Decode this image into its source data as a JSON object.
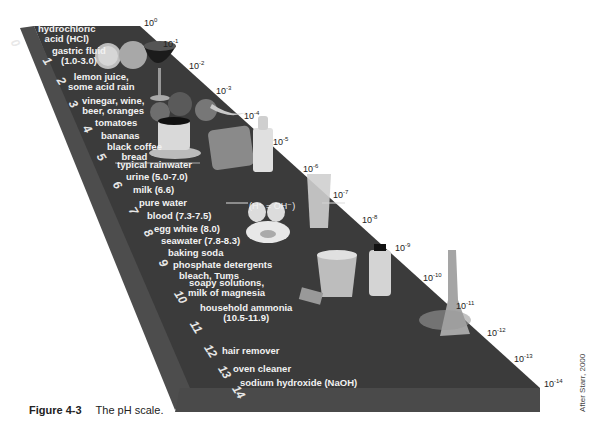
{
  "figure": {
    "number_label": "Figure 4-3",
    "caption": "The pH scale.",
    "credit": "After Starr, 2000"
  },
  "scale": {
    "ph_numbers": [
      "0",
      "1",
      "2",
      "3",
      "4",
      "5",
      "6",
      "7",
      "8",
      "9",
      "10",
      "11",
      "12",
      "13",
      "14"
    ],
    "concentrations": [
      {
        "base": "10",
        "exp": "0"
      },
      {
        "base": "10",
        "exp": "-1"
      },
      {
        "base": "10",
        "exp": "-2"
      },
      {
        "base": "10",
        "exp": "-3"
      },
      {
        "base": "10",
        "exp": "-4"
      },
      {
        "base": "10",
        "exp": "-5"
      },
      {
        "base": "10",
        "exp": "-6"
      },
      {
        "base": "10",
        "exp": "-7"
      },
      {
        "base": "10",
        "exp": "-8"
      },
      {
        "base": "10",
        "exp": "-9"
      },
      {
        "base": "10",
        "exp": "-10"
      },
      {
        "base": "10",
        "exp": "-11"
      },
      {
        "base": "10",
        "exp": "-12"
      },
      {
        "base": "10",
        "exp": "-13"
      },
      {
        "base": "10",
        "exp": "-14"
      }
    ],
    "neutral_equation": "(H⁺ = OH⁻)"
  },
  "substances": [
    {
      "label": "hydrochloric\nacid (HCl)"
    },
    {
      "label": "gastric fluid\n(1.0-3.0)"
    },
    {
      "label": "lemon juice,\nsome acid rain"
    },
    {
      "label": "vinegar, wine,\nbeer, oranges"
    },
    {
      "label": "tomatoes"
    },
    {
      "label": "bananas"
    },
    {
      "label": "black coffee\nbread"
    },
    {
      "label": "typical rainwater"
    },
    {
      "label": "urine (5.0-7.0)"
    },
    {
      "label": "milk (6.6)"
    },
    {
      "label": "pure water"
    },
    {
      "label": "blood (7.3-7.5)"
    },
    {
      "label": "egg white (8.0)"
    },
    {
      "label": "seawater (7.8-8.3)"
    },
    {
      "label": "baking soda"
    },
    {
      "label": "phosphate detergents"
    },
    {
      "label": "bleach, Tums"
    },
    {
      "label": "soapy solutions,\nmilk of magnesia"
    },
    {
      "label": "household ammonia\n(10.5-11.9)"
    },
    {
      "label": "hair remover"
    },
    {
      "label": "oven cleaner"
    },
    {
      "label": "sodium hydroxide (NaOH)"
    }
  ],
  "colors": {
    "slab_top": "#3a3a3a",
    "slab_side": "#4a4a4a",
    "slab_edge": "#555555",
    "label_text": "#f2f2f2",
    "conc_text": "#222222"
  }
}
